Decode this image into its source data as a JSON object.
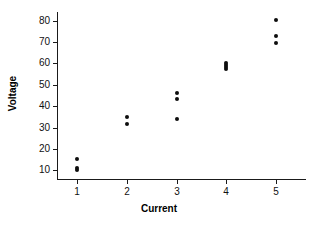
{
  "chart_data": {
    "type": "scatter",
    "title": "",
    "xlabel": "Current",
    "ylabel": "Voltage",
    "xlim": [
      0.6,
      5.6
    ],
    "ylim": [
      6,
      84
    ],
    "grid": false,
    "legend": null,
    "x_ticks": [
      "1",
      "2",
      "3",
      "4",
      "5"
    ],
    "y_ticks": [
      "10",
      "20",
      "30",
      "40",
      "50",
      "60",
      "70",
      "80"
    ],
    "x_tick_values": [
      1,
      2,
      3,
      4,
      5
    ],
    "y_tick_values": [
      10,
      20,
      30,
      40,
      50,
      60,
      70,
      80
    ],
    "marker": "filled-circle",
    "marker_color": "#0d0d0d",
    "points": [
      {
        "x": 1,
        "y": 15.5
      },
      {
        "x": 1,
        "y": 11.0
      },
      {
        "x": 1,
        "y": 10.2
      },
      {
        "x": 2,
        "y": 35.2
      },
      {
        "x": 2,
        "y": 31.5
      },
      {
        "x": 3,
        "y": 46.0
      },
      {
        "x": 3,
        "y": 43.2
      },
      {
        "x": 3,
        "y": 34.2
      },
      {
        "x": 4,
        "y": 60.2
      },
      {
        "x": 4,
        "y": 59.2
      },
      {
        "x": 4,
        "y": 58.2
      },
      {
        "x": 4,
        "y": 57.4
      },
      {
        "x": 5,
        "y": 80.5
      },
      {
        "x": 5,
        "y": 73.0
      },
      {
        "x": 5,
        "y": 69.6
      }
    ]
  },
  "axes": {
    "x_title": "Current",
    "y_title": "Voltage"
  }
}
